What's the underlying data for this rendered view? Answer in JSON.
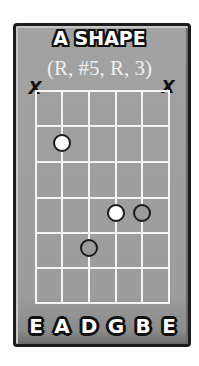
{
  "diagram": {
    "title": "A SHAPE",
    "subtitle": "(R, #5, R, 3)",
    "colors": {
      "frame_background": "#9c9c9c",
      "frame_border": "#1c1c1c",
      "grid_lines": "#f4f4f4",
      "dot_white_fill": "#ffffff",
      "dot_gray_fill": "#9a9a9a",
      "dot_outline": "#1a1a1a"
    },
    "muted_strings": [
      {
        "string": "E (low)",
        "mark": "X"
      },
      {
        "string": "E (high)",
        "mark": "X"
      }
    ],
    "grid": {
      "strings": 6,
      "frets": 6
    },
    "dots": [
      {
        "string_index": 1,
        "string": "A",
        "fret": 2,
        "fill": "white"
      },
      {
        "string_index": 3,
        "string": "G",
        "fret": 4,
        "fill": "white"
      },
      {
        "string_index": 4,
        "string": "B",
        "fret": 4,
        "fill": "gray"
      },
      {
        "string_index": 2,
        "string": "D",
        "fret": 5,
        "fill": "gray"
      }
    ],
    "string_labels": [
      "E",
      "A",
      "D",
      "G",
      "B",
      "E"
    ]
  }
}
